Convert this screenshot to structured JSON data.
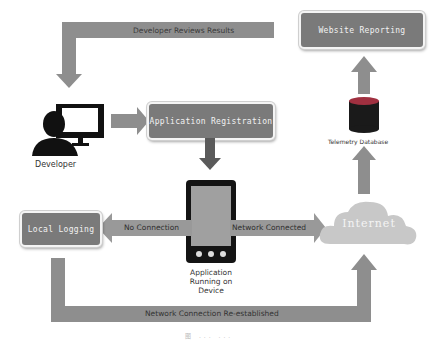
{
  "diagram": {
    "nodes": {
      "website_reporting": "Website Reporting",
      "application_registration": "Application Registration",
      "local_logging": "Local Logging",
      "internet": "Internet",
      "telemetry_database": "Telemetry Database",
      "developer": "Developer",
      "device_line1": "Application",
      "device_line2": "Running on",
      "device_line3": "Device"
    },
    "edges": {
      "developer_reviews_results": "Developer Reviews Results",
      "no_connection": "No Connection",
      "network_connected": "Network Connected",
      "network_reestablished": "Network Connection Re-established"
    },
    "caption": "图 ... ..."
  },
  "colors": {
    "arrow": "#8e8e8e",
    "box": "#7a7a7a",
    "cloud": "#c8c8c8",
    "database": "#a03040"
  }
}
